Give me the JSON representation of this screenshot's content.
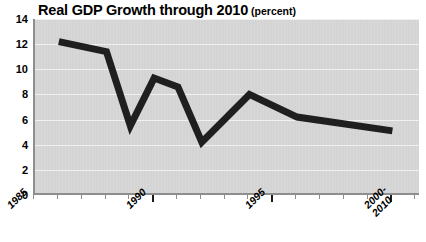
{
  "chart_data": {
    "type": "line",
    "title": "Real GDP Growth through 2010",
    "units": "(percent)",
    "xlabel": "",
    "ylabel": "",
    "grid": true,
    "legend": "none",
    "xlim": [
      1985,
      2001.2
    ],
    "ylim": [
      0,
      14
    ],
    "yticks": [
      14,
      12,
      10,
      8,
      6,
      4,
      2,
      0
    ],
    "xticks_labeled": [
      "1985",
      "1990",
      "1995",
      "2000-2010"
    ],
    "xtick_label_lines": [
      [
        "1985"
      ],
      [
        "1990"
      ],
      [
        "1995"
      ],
      [
        "2000-",
        "2010"
      ]
    ],
    "xticks_major_years": [
      1990,
      1995,
      2000
    ],
    "x": [
      1986,
      1988,
      1989,
      1990,
      1991,
      1992,
      1994,
      1996,
      2000
    ],
    "values": [
      12.2,
      11.4,
      5.5,
      9.3,
      8.6,
      4.2,
      8.0,
      6.2,
      5.1
    ],
    "series": [
      {
        "name": "Real GDP Growth",
        "x": [
          1986,
          1988,
          1989,
          1990,
          1991,
          1992,
          1994,
          1996,
          2000
        ],
        "values": [
          12.2,
          11.4,
          5.5,
          9.3,
          8.6,
          4.2,
          8.0,
          6.2,
          5.1
        ]
      }
    ],
    "colors": {
      "line": "#1f1f1f",
      "plot_background": "#d6d6d6",
      "gridline": "#f2f2f2",
      "axis": "#8e8e8e",
      "text": "#000000",
      "page_background": "#ffffff"
    },
    "line_width_px": 7
  },
  "axes": {
    "y_labels": [
      "14",
      "12",
      "10",
      "8",
      "6",
      "4",
      "2",
      "0"
    ],
    "x_labels": [
      {
        "text": "1985",
        "line2": ""
      },
      {
        "text": "1990",
        "line2": ""
      },
      {
        "text": "1995",
        "line2": ""
      },
      {
        "text": "2000-",
        "line2": "2010"
      }
    ]
  }
}
